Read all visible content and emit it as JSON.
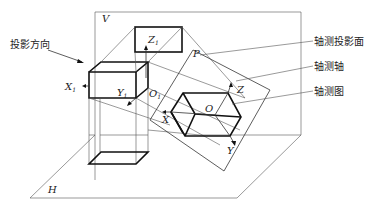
{
  "diagram": {
    "planes": {
      "vertical": "V",
      "horizontal": "H",
      "axonometric": "P"
    },
    "original_axes": {
      "x": "X",
      "x_sub": "1",
      "y": "Y",
      "y_sub": "1",
      "z": "Z",
      "z_sub": "1",
      "origin": "O",
      "origin_sub": "1"
    },
    "axonometric_axes": {
      "x": "X",
      "y": "Y",
      "z": "Z",
      "origin": "O"
    },
    "callouts": {
      "projection_direction": "投影方向",
      "axonometric_plane": "轴测投影面",
      "axonometric_axis": "轴测轴",
      "axonometric_drawing": "轴测图"
    }
  }
}
